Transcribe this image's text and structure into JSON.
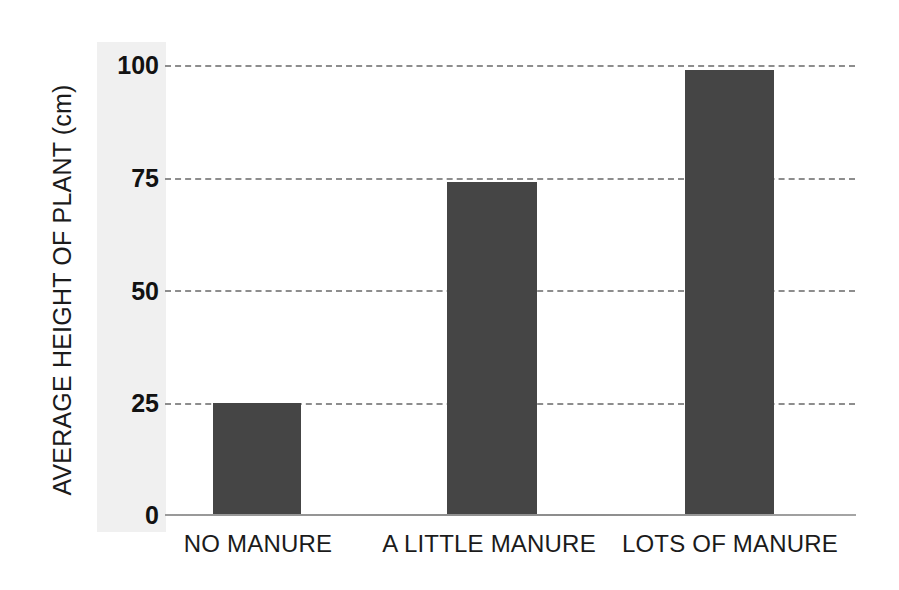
{
  "chart_data": {
    "type": "bar",
    "title": "",
    "xlabel": "",
    "ylabel": "AVERAGE HEIGHT OF PLANT (cm)",
    "categories": [
      "NO MANURE",
      "A LITTLE MANURE",
      "LOTS OF MANURE"
    ],
    "values": [
      25,
      74,
      99
    ],
    "ylim": [
      0,
      100
    ],
    "yticks": [
      0,
      25,
      50,
      75,
      100
    ],
    "ytick_labels": [
      "0",
      "25",
      "50",
      "75",
      "100"
    ],
    "grid": "horizontal-dashed",
    "legend": "none",
    "bar_color": "#454545",
    "gridline_color": "#8d8d8d",
    "axis_color": "#8c8c8c",
    "background_color": "#ffffff",
    "tick_band_color": "#f0f0f0"
  }
}
